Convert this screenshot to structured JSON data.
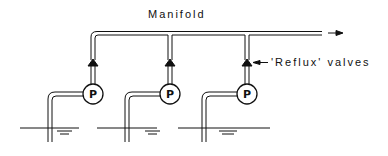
{
  "diagram": {
    "title_label": "Manifold",
    "valve_label": "'Reflux' valves",
    "pump_symbol": "P",
    "components": {
      "pumps": [
        {
          "id": "pump-1",
          "label": "P"
        },
        {
          "id": "pump-2",
          "label": "P"
        },
        {
          "id": "pump-3",
          "label": "P"
        }
      ],
      "valves": [
        {
          "id": "valve-1",
          "type": "reflux-valve-icon"
        },
        {
          "id": "valve-2",
          "type": "reflux-valve-icon"
        },
        {
          "id": "valve-3",
          "type": "reflux-valve-icon"
        }
      ],
      "wells": [
        {
          "id": "well-1",
          "type": "water-level-icon"
        },
        {
          "id": "well-2",
          "type": "water-level-icon"
        },
        {
          "id": "well-3",
          "type": "water-level-icon"
        }
      ],
      "flow_direction": "right-arrow-icon"
    },
    "colors": {
      "line": "#111111",
      "background": "#ffffff"
    }
  }
}
